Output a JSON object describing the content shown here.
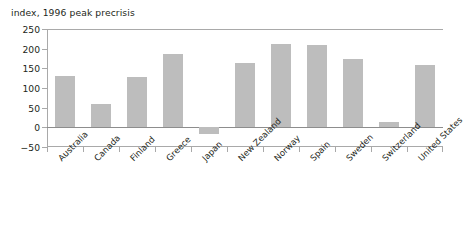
{
  "chart_data": {
    "type": "bar",
    "title": "index, 1996 peak precrisis",
    "xlabel": "",
    "ylabel": "",
    "ylim": [
      -50,
      250
    ],
    "yticks": [
      250,
      200,
      150,
      100,
      50,
      0,
      -50
    ],
    "ytick_labels": [
      "250",
      "200",
      "150",
      "100",
      "50",
      "0",
      "−50"
    ],
    "grid": false,
    "legend": "none",
    "bar_color": "#bdbdbd",
    "zero_line": 0,
    "categories": [
      "Australia",
      "Canada",
      "Finland",
      "Greece",
      "Japan",
      "New Zealand",
      "Norway",
      "Spain",
      "Sweden",
      "Switzerland",
      "United States"
    ],
    "values": [
      131,
      59,
      128,
      187,
      -18,
      163,
      212,
      210,
      174,
      13,
      158
    ]
  }
}
